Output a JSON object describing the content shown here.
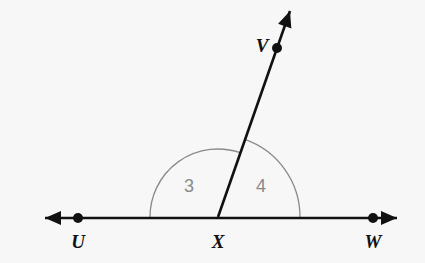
{
  "figure": {
    "kind": "geometry-diagram",
    "background_color": "#f7f7f7",
    "stroke_color": "#111111",
    "arc_color": "#8a8a8a",
    "angle_label_color": "#8a8a8a",
    "point_label_color": "#111111",
    "points": [
      {
        "name": "U",
        "label": "U",
        "x": 78,
        "y": 218,
        "label_x": 78,
        "label_y": 241,
        "dot": true
      },
      {
        "name": "X",
        "label": "X",
        "x": 218,
        "y": 217,
        "label_x": 218,
        "label_y": 241,
        "dot": false
      },
      {
        "name": "W",
        "label": "W",
        "x": 373,
        "y": 218,
        "label_x": 373,
        "label_y": 241,
        "dot": true
      },
      {
        "name": "V",
        "label": "V",
        "x": 277,
        "y": 48,
        "label_x": 262,
        "label_y": 45,
        "dot": true
      }
    ],
    "lines": [
      {
        "name": "line-UW",
        "from_x": 45,
        "from_y": 218,
        "to_x": 397,
        "to_y": 218,
        "arrow_start": true,
        "arrow_end": true
      },
      {
        "name": "ray-XV",
        "from_x": 218,
        "from_y": 217,
        "to_x": 290,
        "to_y": 11,
        "arrow_start": false,
        "arrow_end": true
      }
    ],
    "angles": [
      {
        "name": "angle-3",
        "label": "3",
        "radius": 68,
        "start_deg": 180,
        "end_deg": 71,
        "label_x": 189,
        "label_y": 186
      },
      {
        "name": "angle-4",
        "label": "4",
        "radius": 82,
        "start_deg": 71,
        "end_deg": 0,
        "label_x": 261,
        "label_y": 186
      }
    ],
    "vertex": {
      "x": 218,
      "y": 217
    }
  }
}
